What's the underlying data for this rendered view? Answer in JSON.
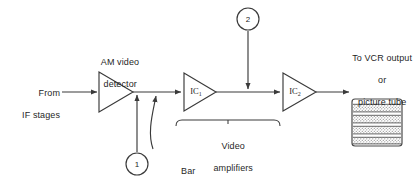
{
  "diagram": {
    "background_color": "#ffffff",
    "line_color": "#3a3a3a",
    "text_color": "#1f1f1f",
    "labels": {
      "input_line1": "From",
      "input_line2": "IF stages",
      "detector_line1": "AM video",
      "detector_line2": "detector",
      "ic1": "IC",
      "ic1_sub": "1",
      "ic2": "IC",
      "ic2_sub": "2",
      "bracket_line1": "Video",
      "bracket_line2": "amplifiers",
      "bar_generator_line1": "Bar",
      "bar_generator_line2": "generator",
      "output_line1": "To VCR output",
      "output_line2": "or",
      "output_line3": "picture tube"
    },
    "test_points": [
      {
        "id": "1",
        "label": "1"
      },
      {
        "id": "2",
        "label": "2"
      }
    ],
    "blocks": [
      {
        "name": "am-video-detector",
        "type": "triangle-amplifier",
        "label": "AM video detector"
      },
      {
        "name": "ic1-amplifier",
        "type": "triangle-amplifier",
        "label": "IC1"
      },
      {
        "name": "ic2-amplifier",
        "type": "triangle-amplifier",
        "label": "IC2"
      },
      {
        "name": "bar-pattern-display",
        "type": "raster-box",
        "bands": 4
      }
    ]
  }
}
